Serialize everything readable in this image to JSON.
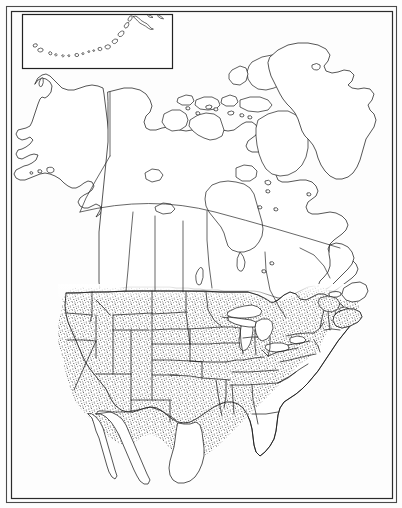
{
  "figure": {
    "type": "distribution-range-map",
    "width": 402,
    "height": 508,
    "background_color": "#fdfdfd",
    "outline_color": "#1d1d1d",
    "stipple_color": "#3a3a3a",
    "frame": {
      "outer": {
        "x": 6,
        "y": 6,
        "width": 390,
        "height": 496
      },
      "inner": {
        "x": 11,
        "y": 11,
        "width": 381,
        "height": 487
      }
    }
  },
  "inset": {
    "name": "aleutian-islands-inset",
    "label": "Aleutian Islands",
    "box": {
      "x": 22,
      "y": 14,
      "width": 150,
      "height": 54
    },
    "island_count": 17
  },
  "range": {
    "name": "species-range",
    "pattern": "stipple",
    "dot_color": "#363636",
    "dot_spacing_px": 2.6,
    "coverage_description": "Conterminous United States including Florida and coastal Texas, extending north across the 49th parallel into southernmost Canada and east into New England and the Maritime provinces.",
    "northern_limit_label": "southern Canada",
    "southern_limit_label": "US-Mexico border",
    "excluded_regions": [
      "Alaska",
      "Baja California",
      "Greenland",
      "Canadian Arctic Archipelago",
      "Hudson Bay region"
    ]
  },
  "landmasses": [
    {
      "name": "alaska",
      "label": "Alaska",
      "stippled": false
    },
    {
      "name": "canada-mainland",
      "label": "Canada",
      "stippled": false
    },
    {
      "name": "greenland",
      "label": "Greenland",
      "stippled": false
    },
    {
      "name": "conterminous-united-states",
      "label": "United States",
      "stippled": true
    },
    {
      "name": "mexico-baja",
      "label": "Baja California",
      "stippled": false
    },
    {
      "name": "newfoundland",
      "label": "Newfoundland",
      "stippled": false
    },
    {
      "name": "nova-scotia",
      "label": "Nova Scotia",
      "stippled": true
    },
    {
      "name": "baffin-island",
      "label": "Baffin Island",
      "stippled": false
    },
    {
      "name": "victoria-island",
      "label": "Victoria Island",
      "stippled": false
    },
    {
      "name": "banks-island",
      "label": "Banks Island",
      "stippled": false
    },
    {
      "name": "ellesmere-island",
      "label": "Ellesmere Island",
      "stippled": false
    }
  ],
  "water_bodies": [
    {
      "name": "hudson-bay",
      "label": "Hudson Bay"
    },
    {
      "name": "great-lakes",
      "label": "Great Lakes"
    },
    {
      "name": "great-salt-lake",
      "label": "Great Salt Lake"
    },
    {
      "name": "lake-winnipeg",
      "label": "Lake Winnipeg"
    },
    {
      "name": "great-bear-lake",
      "label": "Great Bear Lake"
    },
    {
      "name": "great-slave-lake",
      "label": "Great Slave Lake"
    }
  ],
  "boundaries": {
    "international": [
      "United States - Canada",
      "United States - Mexico"
    ],
    "parallel_60_label": "60th parallel",
    "parallel_49_label": "49th parallel",
    "subdivision_type": "state and provincial boundaries"
  },
  "chart_data": {
    "type": "map",
    "projection": "conic",
    "legend_entries": [
      {
        "symbol": "stipple",
        "label": "range"
      },
      {
        "symbol": "outline",
        "label": "no range"
      }
    ],
    "regions": [
      {
        "name": "United States (conterminous)",
        "in_range": true
      },
      {
        "name": "Southern Canada",
        "in_range": true
      },
      {
        "name": "Maritime Provinces",
        "in_range": true
      },
      {
        "name": "Alaska",
        "in_range": false
      },
      {
        "name": "Northern Canada",
        "in_range": false
      },
      {
        "name": "Greenland",
        "in_range": false
      },
      {
        "name": "Mexico",
        "in_range": false
      }
    ]
  }
}
